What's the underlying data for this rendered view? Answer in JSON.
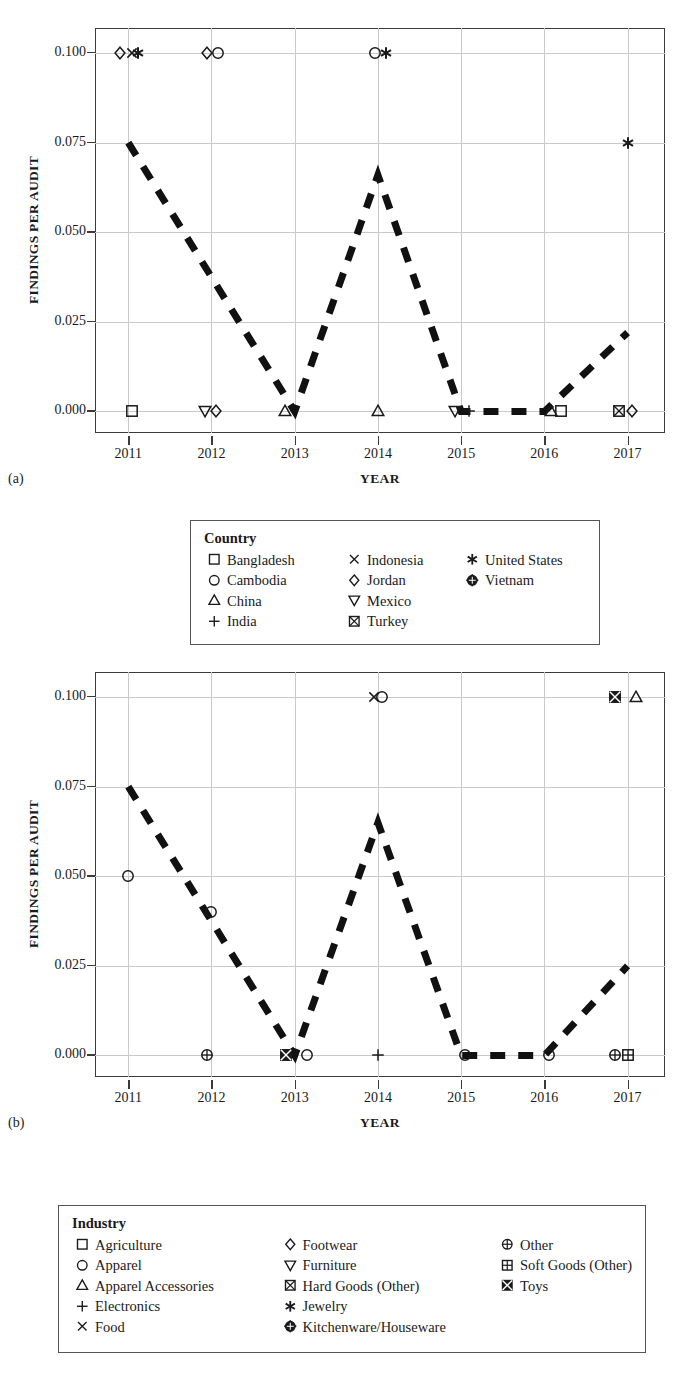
{
  "figure": {
    "panel_a_label": "(a)",
    "panel_b_label": "(b)"
  },
  "axes": {
    "ylabel": "FINDINGS PER AUDIT",
    "xlabel": "YEAR",
    "yticks": [
      "0.000",
      "0.025",
      "0.050",
      "0.075",
      "0.100"
    ],
    "xticks": [
      "2011",
      "2012",
      "2013",
      "2014",
      "2015",
      "2016",
      "2017"
    ]
  },
  "legend_country": {
    "title": "Country",
    "columns": [
      [
        {
          "label": "Bangladesh",
          "marker": "square"
        },
        {
          "label": "Cambodia",
          "marker": "circle"
        },
        {
          "label": "China",
          "marker": "triangle-up"
        },
        {
          "label": "India",
          "marker": "plus"
        }
      ],
      [
        {
          "label": "Indonesia",
          "marker": "cross"
        },
        {
          "label": "Jordan",
          "marker": "diamond"
        },
        {
          "label": "Mexico",
          "marker": "triangle-down"
        },
        {
          "label": "Turkey",
          "marker": "square-cross"
        }
      ],
      [
        {
          "label": "United States",
          "marker": "asterisk"
        },
        {
          "label": "Vietnam",
          "marker": "circle-plus-filled"
        }
      ]
    ]
  },
  "legend_industry": {
    "title": "Industry",
    "columns": [
      [
        {
          "label": "Agriculture",
          "marker": "square"
        },
        {
          "label": "Apparel",
          "marker": "circle"
        },
        {
          "label": "Apparel Accessories",
          "marker": "triangle-up"
        },
        {
          "label": "Electronics",
          "marker": "plus"
        },
        {
          "label": "Food",
          "marker": "cross"
        }
      ],
      [
        {
          "label": "Footwear",
          "marker": "diamond"
        },
        {
          "label": "Furniture",
          "marker": "triangle-down"
        },
        {
          "label": "Hard Goods (Other)",
          "marker": "square-cross"
        },
        {
          "label": "Jewelry",
          "marker": "asterisk"
        },
        {
          "label": "Kitchenware/Houseware",
          "marker": "circle-plus-filled"
        }
      ],
      [
        {
          "label": "Other",
          "marker": "circle-plus"
        },
        {
          "label": "Soft Goods (Other)",
          "marker": "square-grid"
        },
        {
          "label": "Toys",
          "marker": "square-cross-filled"
        }
      ]
    ]
  },
  "chart_data": [
    {
      "id": "panel-a",
      "type": "scatter",
      "title": "",
      "xlabel": "YEAR",
      "ylabel": "FINDINGS PER AUDIT",
      "xlim": [
        2010.6,
        2017.45
      ],
      "ylim": [
        -0.006,
        0.107
      ],
      "grid": true,
      "legend_position": "below-plot",
      "legend_title": "Country",
      "trend_line": {
        "style": "dashed",
        "width": 7,
        "color": "#111111",
        "x": [
          2011,
          2013,
          2014,
          2015,
          2016,
          2017
        ],
        "y": [
          0.075,
          0.0,
          0.066,
          0.0,
          0.0,
          0.022
        ]
      },
      "points": [
        {
          "x": 2010.9,
          "y": 0.1,
          "series": "Jordan",
          "marker": "diamond"
        },
        {
          "x": 2011.05,
          "y": 0.1,
          "series": "Indonesia",
          "marker": "cross"
        },
        {
          "x": 2011.12,
          "y": 0.1,
          "series": "United States",
          "marker": "asterisk"
        },
        {
          "x": 2011.95,
          "y": 0.1,
          "series": "Jordan",
          "marker": "diamond"
        },
        {
          "x": 2012.08,
          "y": 0.1,
          "series": "Cambodia",
          "marker": "circle"
        },
        {
          "x": 2013.97,
          "y": 0.1,
          "series": "Cambodia",
          "marker": "circle"
        },
        {
          "x": 2014.1,
          "y": 0.1,
          "series": "United States",
          "marker": "asterisk"
        },
        {
          "x": 2017.0,
          "y": 0.075,
          "series": "United States",
          "marker": "asterisk"
        },
        {
          "x": 2011.05,
          "y": 0.0,
          "series": "Bangladesh",
          "marker": "square"
        },
        {
          "x": 2011.92,
          "y": 0.0,
          "series": "Mexico",
          "marker": "triangle-down"
        },
        {
          "x": 2012.05,
          "y": 0.0,
          "series": "Jordan",
          "marker": "diamond"
        },
        {
          "x": 2012.88,
          "y": 0.0,
          "series": "China",
          "marker": "triangle-up"
        },
        {
          "x": 2014.0,
          "y": 0.0,
          "series": "China",
          "marker": "triangle-up"
        },
        {
          "x": 2014.93,
          "y": 0.0,
          "series": "Mexico",
          "marker": "triangle-down"
        },
        {
          "x": 2015.1,
          "y": 0.0,
          "series": "India",
          "marker": "plus"
        },
        {
          "x": 2016.08,
          "y": 0.0,
          "series": "China",
          "marker": "triangle-up"
        },
        {
          "x": 2016.2,
          "y": 0.0,
          "series": "Bangladesh",
          "marker": "square"
        },
        {
          "x": 2016.9,
          "y": 0.0,
          "series": "Turkey",
          "marker": "square-cross"
        },
        {
          "x": 2017.05,
          "y": 0.0,
          "series": "Jordan",
          "marker": "diamond"
        }
      ]
    },
    {
      "id": "panel-b",
      "type": "scatter",
      "title": "",
      "xlabel": "YEAR",
      "ylabel": "FINDINGS PER AUDIT",
      "xlim": [
        2010.6,
        2017.45
      ],
      "ylim": [
        -0.006,
        0.107
      ],
      "grid": true,
      "legend_position": "below-plot",
      "legend_title": "Industry",
      "trend_line": {
        "style": "dashed",
        "width": 7,
        "color": "#111111",
        "x": [
          2011,
          2013,
          2014,
          2015,
          2016,
          2017
        ],
        "y": [
          0.075,
          0.0,
          0.065,
          0.0,
          0.0,
          0.025
        ]
      },
      "points": [
        {
          "x": 2013.95,
          "y": 0.1,
          "series": "Food",
          "marker": "cross"
        },
        {
          "x": 2014.05,
          "y": 0.1,
          "series": "Apparel",
          "marker": "circle"
        },
        {
          "x": 2016.85,
          "y": 0.1,
          "series": "Toys",
          "marker": "square-cross-filled"
        },
        {
          "x": 2017.1,
          "y": 0.1,
          "series": "Apparel Accessories",
          "marker": "triangle-up"
        },
        {
          "x": 2011.0,
          "y": 0.05,
          "series": "Apparel",
          "marker": "circle"
        },
        {
          "x": 2012.0,
          "y": 0.04,
          "series": "Apparel",
          "marker": "circle"
        },
        {
          "x": 2011.95,
          "y": 0.0,
          "series": "Other",
          "marker": "circle-plus"
        },
        {
          "x": 2012.9,
          "y": 0.0,
          "series": "Toys",
          "marker": "square-cross-filled"
        },
        {
          "x": 2013.15,
          "y": 0.0,
          "series": "Apparel",
          "marker": "circle"
        },
        {
          "x": 2014.0,
          "y": 0.0,
          "series": "Electronics",
          "marker": "plus"
        },
        {
          "x": 2015.05,
          "y": 0.0,
          "series": "Apparel",
          "marker": "circle"
        },
        {
          "x": 2016.05,
          "y": 0.0,
          "series": "Apparel",
          "marker": "circle"
        },
        {
          "x": 2016.85,
          "y": 0.0,
          "series": "Other",
          "marker": "circle-plus"
        },
        {
          "x": 2017.0,
          "y": 0.0,
          "series": "Soft Goods (Other)",
          "marker": "square-grid"
        }
      ]
    }
  ]
}
